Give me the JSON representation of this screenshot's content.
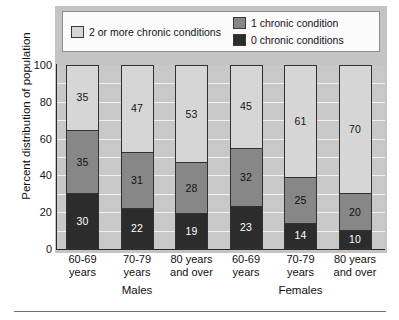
{
  "chart_data": {
    "type": "bar",
    "subtype": "stacked-bar-100",
    "title": "",
    "xlabel": "",
    "ylabel": "Percent distribution of population",
    "ylim": [
      0,
      100
    ],
    "yticks": [
      100,
      80,
      60,
      40,
      20,
      0
    ],
    "grid": true,
    "grid_orientation": "horizontal",
    "legend_position": "top",
    "categories": [
      "60-69 years",
      "70-79 years",
      "80 years and over",
      "60-69 years",
      "70-79 years",
      "80 years and over"
    ],
    "category_lines": [
      [
        "60-69",
        "years"
      ],
      [
        "70-79",
        "years"
      ],
      [
        "80 years",
        "and over"
      ],
      [
        "60-69",
        "years"
      ],
      [
        "70-79",
        "years"
      ],
      [
        "80 years",
        "and over"
      ]
    ],
    "groups": [
      {
        "label": "Males",
        "categories": [
          0,
          1,
          2
        ]
      },
      {
        "label": "Females",
        "categories": [
          3,
          4,
          5
        ]
      }
    ],
    "series": [
      {
        "name": "0 chronic conditions",
        "color": "#2c2c2c",
        "values": [
          30,
          22,
          19,
          23,
          14,
          10
        ]
      },
      {
        "name": "1 chronic condition",
        "color": "#878787",
        "values": [
          35,
          31,
          28,
          32,
          25,
          20
        ]
      },
      {
        "name": "2 or more chronic conditions",
        "color": "#d6d6d6",
        "values": [
          35,
          47,
          53,
          45,
          61,
          70
        ]
      }
    ]
  },
  "legend": {
    "entries": [
      {
        "label": "2 or more chronic conditions",
        "swatch": "light"
      },
      {
        "label": "1 chronic condition",
        "swatch": "mid"
      },
      {
        "label": "0 chronic conditions",
        "swatch": "dark"
      }
    ]
  },
  "colors": {
    "zero_conditions": "#2c2c2c",
    "one_condition": "#878787",
    "two_or_more": "#d6d6d6",
    "plot_background": "#c8c8c8",
    "canvas_background": "#c4c4c4",
    "gridline": "#f2f2f2",
    "axis": "#2a2a2a"
  }
}
